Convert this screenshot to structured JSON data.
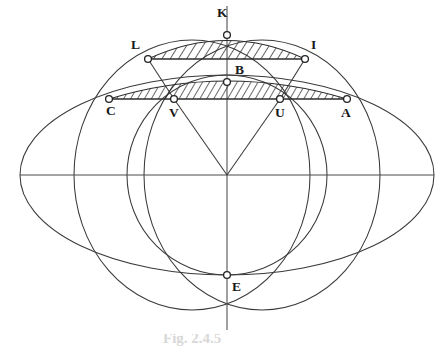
{
  "figure": {
    "caption": "Fig. 2.4.5",
    "background_color": "#ffffff",
    "line_color": "#3a3a3a",
    "hatch_color": "#2b2b2b"
  },
  "points": [
    {
      "id": "K",
      "label": "K",
      "x": 227,
      "y": 35,
      "label_x": 217,
      "label_y": 6
    },
    {
      "id": "L",
      "label": "L",
      "x": 148,
      "y": 59,
      "label_x": 131,
      "label_y": 38
    },
    {
      "id": "I",
      "label": "I",
      "x": 305,
      "y": 59,
      "label_x": 311,
      "label_y": 38
    },
    {
      "id": "B",
      "label": "B",
      "x": 227,
      "y": 82,
      "label_x": 235,
      "label_y": 63
    },
    {
      "id": "C",
      "label": "C",
      "x": 109,
      "y": 99,
      "label_x": 106,
      "label_y": 104
    },
    {
      "id": "V",
      "label": "V",
      "x": 174,
      "y": 99,
      "label_x": 169,
      "label_y": 106
    },
    {
      "id": "U",
      "label": "U",
      "x": 280,
      "y": 99,
      "label_x": 275,
      "label_y": 106
    },
    {
      "id": "A",
      "label": "A",
      "x": 347,
      "y": 99,
      "label_x": 341,
      "label_y": 106
    },
    {
      "id": "E",
      "label": "E",
      "x": 227,
      "y": 275,
      "label_x": 232,
      "label_y": 280
    }
  ],
  "center": {
    "x": 227,
    "y": 175
  },
  "geometry": {
    "outer_ellipse": {
      "cx": 227,
      "cy": 175,
      "rx": 207,
      "ry": 100
    },
    "left_circle": {
      "cx": 192,
      "cy": 175,
      "rx": 118,
      "ry": 135
    },
    "right_circle": {
      "cx": 262,
      "cy": 175,
      "rx": 118,
      "ry": 135
    },
    "middle_circle": {
      "cx": 227,
      "cy": 175,
      "rx": 100,
      "ry": 100
    },
    "vertical_axis": {
      "x": 227,
      "y1": 6,
      "y2": 330
    },
    "horizontal_axis": {
      "y": 175,
      "x1": 20,
      "x2": 434
    }
  },
  "hatched_regions": [
    {
      "name": "upper-lune-LKI",
      "chord_from": "L",
      "chord_to": "I",
      "apex": "K"
    },
    {
      "name": "lower-lune-CBA",
      "chord_from": "C",
      "chord_to": "A",
      "apex": "B"
    }
  ],
  "chords": [
    {
      "from": "L",
      "to": "I"
    },
    {
      "from": "C",
      "to": "A"
    }
  ],
  "radii": [
    {
      "from": "center",
      "to": "V"
    },
    {
      "from": "center",
      "to": "U"
    },
    {
      "from": "center",
      "to": "K"
    },
    {
      "from": "center",
      "to": "E"
    }
  ]
}
